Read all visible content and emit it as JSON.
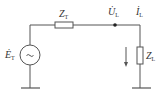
{
  "diagram": {
    "type": "circuit",
    "source": {
      "label": "Ė",
      "sub": "T",
      "symbol": "~"
    },
    "series_impedance": {
      "label": "Z",
      "sub": "T"
    },
    "node_voltage": {
      "label": "U̇",
      "sub": "L"
    },
    "current": {
      "label": "İ",
      "sub": "L"
    },
    "load_impedance": {
      "label": "Z",
      "sub": "L"
    },
    "colors": {
      "line": "#555555",
      "text": "#333333",
      "background": "#ffffff"
    }
  }
}
